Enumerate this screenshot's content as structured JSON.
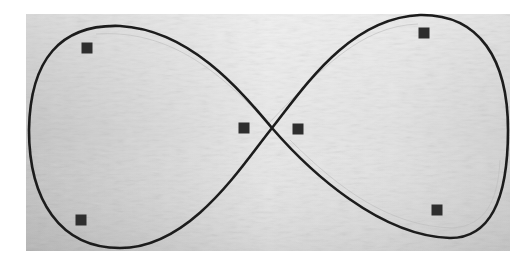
{
  "image": {
    "description": "Photograph of a white textured board with a hand-drawn figure-eight (infinity) loop and six small dark square markers",
    "background_color": "#ffffff",
    "board": {
      "x": 26,
      "y": 14,
      "width": 484,
      "height": 237,
      "color_left": "#c9c9c9",
      "color_center": "#e6e6e6",
      "color_right": "#dcdcdc"
    },
    "curve": {
      "shape": "figure-eight",
      "stroke": "#1c1c1c",
      "stroke_width": 2.6,
      "crossing_point": [
        272,
        128
      ]
    },
    "markers": [
      {
        "id": "top-left",
        "x": 87,
        "y": 48,
        "size": 11
      },
      {
        "id": "center-left",
        "x": 244,
        "y": 128,
        "size": 11
      },
      {
        "id": "center-right",
        "x": 298,
        "y": 129,
        "size": 11
      },
      {
        "id": "top-right",
        "x": 424,
        "y": 33,
        "size": 11
      },
      {
        "id": "bottom-left",
        "x": 81,
        "y": 220,
        "size": 11
      },
      {
        "id": "bottom-right",
        "x": 437,
        "y": 210,
        "size": 11
      }
    ],
    "marker_color": "#2e2e2e"
  }
}
